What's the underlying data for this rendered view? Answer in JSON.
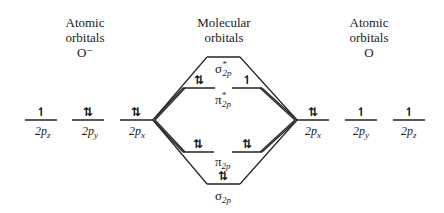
{
  "headers": {
    "left": {
      "line1": "Atomic",
      "line2": "orbitals",
      "line3": "O⁻"
    },
    "center": {
      "line1": "Molecular",
      "line2": "orbitals"
    },
    "right": {
      "line1": "Atomic",
      "line2": "orbitals",
      "line3": "O"
    }
  },
  "left_atom": {
    "orbitals": [
      {
        "label": "2p",
        "sub": "z",
        "electrons": "↿"
      },
      {
        "label": "2p",
        "sub": "y",
        "electrons": "⇅"
      },
      {
        "label": "2p",
        "sub": "x",
        "electrons": "⇅"
      }
    ]
  },
  "right_atom": {
    "orbitals": [
      {
        "label": "2p",
        "sub": "x",
        "electrons": "⇅"
      },
      {
        "label": "2p",
        "sub": "y",
        "electrons": "↿"
      },
      {
        "label": "2p",
        "sub": "z",
        "electrons": "↿"
      }
    ]
  },
  "molecular": {
    "sigma_star": {
      "symbol": "σ",
      "sup": "*",
      "sub": "2p",
      "electrons": ""
    },
    "pi_star": {
      "symbol": "π",
      "sup": "*",
      "sub": "2p",
      "electrons_left": "⇅",
      "electrons_right": "↿"
    },
    "pi": {
      "symbol": "π",
      "sub": "2p",
      "electrons_left": "⇅",
      "electrons_right": "⇅"
    },
    "sigma": {
      "symbol": "σ",
      "sub": "2p",
      "electrons": "⇅"
    }
  }
}
